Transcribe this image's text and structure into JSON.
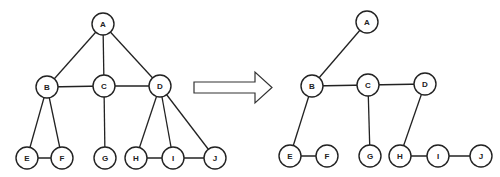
{
  "left_graph": {
    "name": "original-graph",
    "nodes": [
      {
        "id": "A",
        "label": "A",
        "x": 103,
        "y": 24
      },
      {
        "id": "B",
        "label": "B",
        "x": 47,
        "y": 87
      },
      {
        "id": "C",
        "label": "C",
        "x": 104,
        "y": 86
      },
      {
        "id": "D",
        "label": "D",
        "x": 160,
        "y": 86
      },
      {
        "id": "E",
        "label": "E",
        "x": 27,
        "y": 158
      },
      {
        "id": "F",
        "label": "F",
        "x": 62,
        "y": 158
      },
      {
        "id": "G",
        "label": "G",
        "x": 105,
        "y": 158
      },
      {
        "id": "H",
        "label": "H",
        "x": 136,
        "y": 158
      },
      {
        "id": "I",
        "label": "I",
        "x": 173,
        "y": 158
      },
      {
        "id": "J",
        "label": "J",
        "x": 215,
        "y": 158
      }
    ],
    "edges": [
      [
        "A",
        "B"
      ],
      [
        "A",
        "C"
      ],
      [
        "A",
        "D"
      ],
      [
        "B",
        "C"
      ],
      [
        "C",
        "D"
      ],
      [
        "B",
        "E"
      ],
      [
        "B",
        "F"
      ],
      [
        "E",
        "F"
      ],
      [
        "C",
        "G"
      ],
      [
        "D",
        "H"
      ],
      [
        "D",
        "I"
      ],
      [
        "D",
        "J"
      ],
      [
        "H",
        "I"
      ],
      [
        "I",
        "J"
      ]
    ]
  },
  "right_graph": {
    "name": "spanning-tree",
    "nodes": [
      {
        "id": "A",
        "label": "A",
        "x": 367,
        "y": 22
      },
      {
        "id": "B",
        "label": "B",
        "x": 312,
        "y": 86
      },
      {
        "id": "C",
        "label": "C",
        "x": 368,
        "y": 85
      },
      {
        "id": "D",
        "label": "D",
        "x": 425,
        "y": 84
      },
      {
        "id": "E",
        "label": "E",
        "x": 290,
        "y": 156
      },
      {
        "id": "F",
        "label": "F",
        "x": 327,
        "y": 156
      },
      {
        "id": "G",
        "label": "G",
        "x": 370,
        "y": 156
      },
      {
        "id": "H",
        "label": "H",
        "x": 400,
        "y": 156
      },
      {
        "id": "I",
        "label": "I",
        "x": 438,
        "y": 156
      },
      {
        "id": "J",
        "label": "J",
        "x": 481,
        "y": 156
      }
    ],
    "edges": [
      [
        "A",
        "B"
      ],
      [
        "B",
        "C"
      ],
      [
        "C",
        "D"
      ],
      [
        "B",
        "E"
      ],
      [
        "E",
        "F"
      ],
      [
        "C",
        "G"
      ],
      [
        "D",
        "H"
      ],
      [
        "H",
        "I"
      ],
      [
        "I",
        "J"
      ]
    ]
  },
  "arrow": {
    "direction": "right",
    "x_start": 194,
    "x_end": 272,
    "y_center": 87
  },
  "node_radius": 11
}
